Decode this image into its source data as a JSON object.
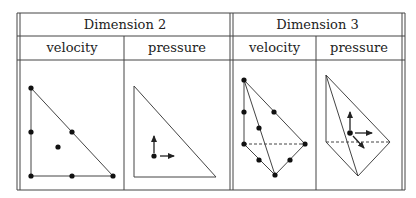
{
  "table": {
    "groups": [
      {
        "label": "Dimension 2",
        "columns": [
          {
            "label": "velocity"
          },
          {
            "label": "pressure"
          }
        ]
      },
      {
        "label": "Dimension 3",
        "columns": [
          {
            "label": "velocity"
          },
          {
            "label": "pressure"
          }
        ]
      }
    ]
  },
  "figures": {
    "dim2_velocity": {
      "shape": "triangle",
      "nodes": 7,
      "description": "P2 triangle with vertex, edge-midpoint and center nodes"
    },
    "dim2_pressure": {
      "shape": "triangle",
      "nodes": 1,
      "description": "single interior node with two vector arrows"
    },
    "dim3_velocity": {
      "shape": "tetrahedron",
      "nodes": 10,
      "description": "P2 tetrahedron with vertex and edge-midpoint nodes"
    },
    "dim3_pressure": {
      "shape": "tetrahedron",
      "nodes": 1,
      "description": "single interior node with three vector arrows"
    }
  },
  "colors": {
    "line": "#333333",
    "background": "#ffffff"
  }
}
